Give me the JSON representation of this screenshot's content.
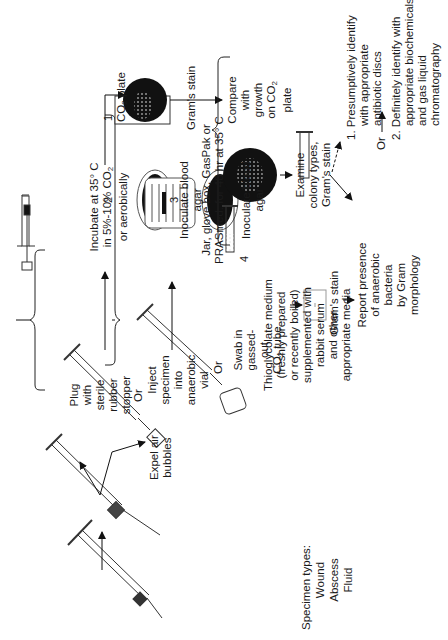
{
  "specimen": {
    "heading": "Specimen types:",
    "types": [
      "Wound",
      "Abscess",
      "Fluid"
    ]
  },
  "collection": {
    "expel": [
      "Expel air",
      "bubbles"
    ],
    "plug": [
      "Plug",
      "with",
      "sterile",
      "rubber",
      "stopper"
    ],
    "or1": "Or",
    "inject": [
      "Inject",
      "specimen",
      "into",
      "anaerobic",
      "vial"
    ],
    "or2": "Or",
    "swab": [
      "Swab in",
      "gassed-",
      "out"
    ],
    "swab_tube": "CO",
    "swab_tube_suffix": "tube"
  },
  "processing": {
    "steps": [
      {
        "number": "1",
        "label": "Gram's stain"
      },
      {
        "number": "2",
        "label": [
          "Inoculate blood",
          "agar"
        ]
      },
      {
        "number": "3",
        "label": [
          "Inoculate blood",
          "agar"
        ]
      },
      {
        "number": "4",
        "label": [
          "Thioglycolate medium",
          "(freshly prepared",
          "or recently boiled)",
          "supplemented with",
          "rabbit serum",
          "and other",
          "appropriate media"
        ]
      }
    ]
  },
  "incubation": {
    "aerobic": [
      "Incubate at 35° C",
      "in 5%-10% CO",
      "or aerobically"
    ],
    "anaerobic": [
      "Jar, glove box, GasPak or",
      "PRASmed. for 48 hr at 35° C"
    ]
  },
  "results": {
    "co2_plate": "CO",
    "co2_plate_suffix": "plate",
    "compare": [
      "Compare",
      "with",
      "growth",
      "on CO",
      "plate"
    ],
    "examine": [
      "Examine",
      "colony types,",
      "Gram's stain"
    ],
    "thio_gram": "Gram's stain",
    "report": [
      "Report presence",
      "of anaerobic",
      "bacteria",
      "by Gram",
      "morphology"
    ],
    "or": "Or",
    "identify": [
      {
        "number": "1.",
        "lines": [
          "Presumptively identify",
          "with appropriate",
          "antibiotic discs"
        ]
      },
      {
        "number": "2.",
        "lines": [
          "Definitely identify with",
          "appropriate biochemicals",
          "and gas liquid",
          "chromatography"
        ]
      }
    ]
  }
}
